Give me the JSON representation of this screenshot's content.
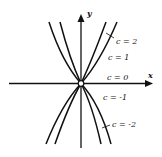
{
  "diagram": {
    "axes": {
      "x_label": "x",
      "y_label": "y",
      "origin_marker": "open-circle"
    },
    "curves": [
      {
        "c": 2,
        "label": "c = 2"
      },
      {
        "c": 1,
        "label": "c = 1"
      },
      {
        "c": 0,
        "label": "c = 0"
      },
      {
        "c": -1,
        "label": "c = -1"
      },
      {
        "c": -2,
        "label": "c = -2"
      }
    ],
    "colors": {
      "ink": "#111111",
      "background": "#ffffff"
    }
  }
}
